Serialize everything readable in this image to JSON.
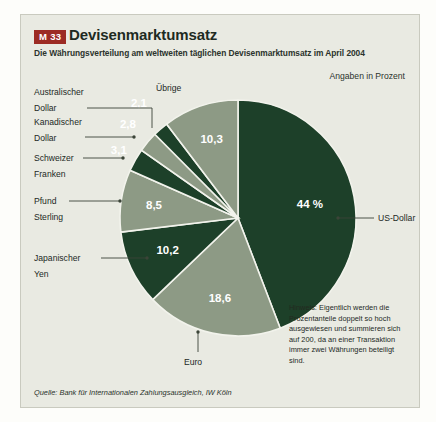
{
  "panel": {
    "badge": "M 33",
    "title": "Devisenmarktumsatz",
    "subtitle": "Die Währungsverteilung am weltweiten täglichen Devisenmarktumsatz im April 2004",
    "unit_note": "Angaben in Prozent",
    "note": "Hinweis: Eigentlich werden die Prozentanteile doppelt so hoch ausgewiesen und summieren sich auf 200, da an einer Transaktion immer zwei Währungen beteiligt sind.",
    "source": "Quelle: Bank für Internationalen Zahlungsausgleich, IW Köln"
  },
  "colors": {
    "badge_bg": "#9c2b24",
    "panel_bg": "#e9eae2",
    "dark_green": "#1d4029",
    "sage_green": "#8d9a85",
    "text": "#22291f"
  },
  "chart_data": {
    "type": "pie",
    "title": "Devisenmarktumsatz",
    "subtitle": "Die Währungsverteilung am weltweiten täglichen Devisenmarktumsatz im April 2004",
    "unit": "Prozent",
    "start_angle_deg": 0,
    "direction": "clockwise",
    "total": 100.0,
    "categories": [
      "US-Dollar",
      "Euro",
      "Japanischer Yen",
      "Pfund Sterling",
      "Schweizer Franken",
      "Kanadischer Dollar",
      "Australischer Dollar",
      "Übrige"
    ],
    "values": [
      44.0,
      18.6,
      10.2,
      8.5,
      3.1,
      2.8,
      2.1,
      10.3
    ],
    "value_labels": [
      "44 %",
      "18,6",
      "10,2",
      "8,5",
      "3,1",
      "2,8",
      "2,1",
      "10,3"
    ],
    "slice_colors": [
      "#1d4029",
      "#8d9a85",
      "#1d4029",
      "#8d9a85",
      "#1d4029",
      "#8d9a85",
      "#1d4029",
      "#8d9a85"
    ],
    "label_colors": [
      "#ffffff",
      "#ffffff",
      "#ffffff",
      "#ffffff",
      "#22291f",
      "#22291f",
      "#22291f",
      "#22291f"
    ],
    "legend_position": "callouts"
  },
  "labels": {
    "australischer_dollar": "Australischer\nDollar",
    "australischer_dollar_l1": "Australischer",
    "australischer_dollar_l2": "Dollar",
    "kanadischer_dollar_l1": "Kanadischer",
    "kanadischer_dollar_l2": "Dollar",
    "schweizer_franken_l1": "Schweizer",
    "schweizer_franken_l2": "Franken",
    "pfund_sterling_l1": "Pfund",
    "pfund_sterling_l2": "Sterling",
    "japanischer_yen_l1": "Japanischer",
    "japanischer_yen_l2": "Yen",
    "uebrige": "Übrige",
    "euro": "Euro",
    "us_dollar": "US-Dollar"
  }
}
